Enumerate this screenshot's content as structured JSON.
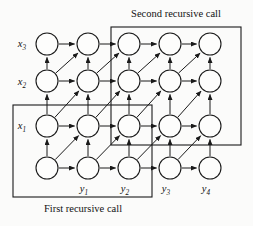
{
  "figure": {
    "type": "diagram",
    "background_color": "#fbfbfa",
    "ink_color": "#1a1a1a"
  },
  "labels": {
    "row_labels": [
      {
        "name": "x",
        "sub": "3",
        "x": 22,
        "y": 47
      },
      {
        "name": "x",
        "sub": "2",
        "x": 22,
        "y": 85
      },
      {
        "name": "x",
        "sub": "1",
        "x": 22,
        "y": 129
      }
    ],
    "column_labels": [
      {
        "name": "y",
        "sub": "1",
        "x": 84,
        "y": 192
      },
      {
        "name": "y",
        "sub": "2",
        "x": 125,
        "y": 192
      },
      {
        "name": "y",
        "sub": "3",
        "x": 166,
        "y": 192
      },
      {
        "name": "y",
        "sub": "4",
        "x": 206,
        "y": 192
      }
    ]
  },
  "annotations": [
    {
      "id": "second-recursive-call",
      "text": "Second recursive call",
      "text_x": 176,
      "text_y": 17,
      "text_anchor": "middle",
      "box": {
        "x": 111,
        "y": 27,
        "width": 130,
        "height": 118
      }
    },
    {
      "id": "first-recursive-call",
      "text": "First recursive call",
      "text_x": 83,
      "text_y": 212,
      "text_anchor": "middle",
      "box": {
        "x": 13,
        "y": 105,
        "width": 139,
        "height": 92
      }
    }
  ],
  "graph": {
    "node_radius": 11,
    "columns_x": [
      47,
      88,
      129,
      170,
      210
    ],
    "rows_y": [
      44,
      81,
      126,
      168
    ],
    "nodes": [
      {
        "id": "r0c0",
        "cx": 47,
        "cy": 44
      },
      {
        "id": "r0c1",
        "cx": 88,
        "cy": 44
      },
      {
        "id": "r0c2",
        "cx": 129,
        "cy": 44
      },
      {
        "id": "r0c3",
        "cx": 170,
        "cy": 44
      },
      {
        "id": "r0c4",
        "cx": 210,
        "cy": 44
      },
      {
        "id": "r1c0",
        "cx": 47,
        "cy": 81
      },
      {
        "id": "r1c1",
        "cx": 88,
        "cy": 81
      },
      {
        "id": "r1c2",
        "cx": 129,
        "cy": 81
      },
      {
        "id": "r1c3",
        "cx": 170,
        "cy": 81
      },
      {
        "id": "r1c4",
        "cx": 210,
        "cy": 81
      },
      {
        "id": "r2c0",
        "cx": 47,
        "cy": 126
      },
      {
        "id": "r2c1",
        "cx": 88,
        "cy": 126
      },
      {
        "id": "r2c2",
        "cx": 129,
        "cy": 126
      },
      {
        "id": "r2c3",
        "cx": 170,
        "cy": 126
      },
      {
        "id": "r2c4",
        "cx": 210,
        "cy": 126
      },
      {
        "id": "r3c0",
        "cx": 47,
        "cy": 168
      },
      {
        "id": "r3c1",
        "cx": 88,
        "cy": 168
      },
      {
        "id": "r3c2",
        "cx": 129,
        "cy": 168
      },
      {
        "id": "r3c3",
        "cx": 170,
        "cy": 168
      },
      {
        "id": "r3c4",
        "cx": 210,
        "cy": 168
      }
    ],
    "edges": [
      {
        "from": "r0c0",
        "to": "r0c1",
        "kind": "horizontal"
      },
      {
        "from": "r0c1",
        "to": "r0c2",
        "kind": "horizontal"
      },
      {
        "from": "r0c2",
        "to": "r0c3",
        "kind": "horizontal"
      },
      {
        "from": "r0c3",
        "to": "r0c4",
        "kind": "horizontal"
      },
      {
        "from": "r1c0",
        "to": "r1c1",
        "kind": "horizontal"
      },
      {
        "from": "r1c1",
        "to": "r1c2",
        "kind": "horizontal"
      },
      {
        "from": "r1c2",
        "to": "r1c3",
        "kind": "horizontal"
      },
      {
        "from": "r1c3",
        "to": "r1c4",
        "kind": "horizontal"
      },
      {
        "from": "r2c0",
        "to": "r2c1",
        "kind": "horizontal"
      },
      {
        "from": "r2c1",
        "to": "r2c2",
        "kind": "horizontal"
      },
      {
        "from": "r2c2",
        "to": "r2c3",
        "kind": "horizontal"
      },
      {
        "from": "r2c3",
        "to": "r2c4",
        "kind": "horizontal"
      },
      {
        "from": "r3c0",
        "to": "r3c1",
        "kind": "horizontal"
      },
      {
        "from": "r3c1",
        "to": "r3c2",
        "kind": "horizontal"
      },
      {
        "from": "r3c2",
        "to": "r3c3",
        "kind": "horizontal"
      },
      {
        "from": "r3c3",
        "to": "r3c4",
        "kind": "horizontal"
      },
      {
        "from": "r1c0",
        "to": "r0c0",
        "kind": "vertical"
      },
      {
        "from": "r1c1",
        "to": "r0c1",
        "kind": "vertical"
      },
      {
        "from": "r1c2",
        "to": "r0c2",
        "kind": "vertical"
      },
      {
        "from": "r1c3",
        "to": "r0c3",
        "kind": "vertical"
      },
      {
        "from": "r1c4",
        "to": "r0c4",
        "kind": "vertical"
      },
      {
        "from": "r2c0",
        "to": "r1c0",
        "kind": "vertical"
      },
      {
        "from": "r2c1",
        "to": "r1c1",
        "kind": "vertical"
      },
      {
        "from": "r2c2",
        "to": "r1c2",
        "kind": "vertical"
      },
      {
        "from": "r2c3",
        "to": "r1c3",
        "kind": "vertical"
      },
      {
        "from": "r2c4",
        "to": "r1c4",
        "kind": "vertical"
      },
      {
        "from": "r3c0",
        "to": "r2c0",
        "kind": "vertical"
      },
      {
        "from": "r3c1",
        "to": "r2c1",
        "kind": "vertical"
      },
      {
        "from": "r3c2",
        "to": "r2c2",
        "kind": "vertical"
      },
      {
        "from": "r3c3",
        "to": "r2c3",
        "kind": "vertical"
      },
      {
        "from": "r3c4",
        "to": "r2c4",
        "kind": "vertical"
      },
      {
        "from": "r1c0",
        "to": "r0c1",
        "kind": "diagonal"
      },
      {
        "from": "r1c1",
        "to": "r0c2",
        "kind": "diagonal"
      },
      {
        "from": "r1c2",
        "to": "r0c3",
        "kind": "diagonal"
      },
      {
        "from": "r1c3",
        "to": "r0c4",
        "kind": "diagonal"
      },
      {
        "from": "r2c0",
        "to": "r1c1",
        "kind": "diagonal"
      },
      {
        "from": "r2c1",
        "to": "r1c2",
        "kind": "diagonal"
      },
      {
        "from": "r2c2",
        "to": "r1c3",
        "kind": "diagonal"
      },
      {
        "from": "r2c3",
        "to": "r1c4",
        "kind": "diagonal"
      },
      {
        "from": "r3c0",
        "to": "r2c1",
        "kind": "diagonal"
      },
      {
        "from": "r3c1",
        "to": "r2c2",
        "kind": "diagonal"
      },
      {
        "from": "r3c2",
        "to": "r2c3",
        "kind": "diagonal"
      },
      {
        "from": "r3c3",
        "to": "r2c4",
        "kind": "diagonal"
      }
    ]
  }
}
